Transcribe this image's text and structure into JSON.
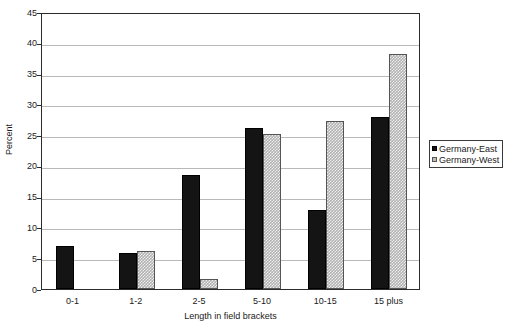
{
  "chart_data": {
    "type": "bar",
    "title": "",
    "subtitle": "",
    "xlabel": "Length in field brackets",
    "ylabel": "Percent",
    "categories": [
      "0-1",
      "1-2",
      "2-5",
      "5-10",
      "10-15",
      "15 plus"
    ],
    "series": [
      {
        "name": "Germany-East",
        "color": "#141414",
        "values": [
          7.0,
          5.9,
          18.5,
          26.1,
          12.8,
          28.0
        ]
      },
      {
        "name": "Germany-West",
        "color": "#b2b2b2",
        "values": [
          0.0,
          6.2,
          1.7,
          25.2,
          27.3,
          38.2
        ]
      }
    ],
    "ylim": [
      0,
      45
    ],
    "yticks": [
      0,
      5,
      10,
      15,
      20,
      25,
      30,
      35,
      40,
      45
    ],
    "ytick_labels": [
      "0",
      "5",
      "10",
      "15",
      "20",
      "25",
      "30",
      "35",
      "40",
      "45"
    ],
    "grid": true,
    "grid_axis": "y",
    "legend_position": "right",
    "legend_entries": [
      "Germany-East",
      "Germany-West"
    ]
  }
}
